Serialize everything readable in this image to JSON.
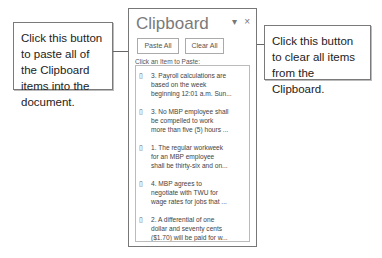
{
  "panel": {
    "title": "Clipboard",
    "dropdown_icon": "▾",
    "close_icon": "×",
    "paste_all_label": "Paste All",
    "clear_all_label": "Clear All",
    "hint": "Click an Item to Paste:"
  },
  "items": [
    {
      "text": "3. Payroll calculations are\nbased on the week\nbeginning 12:01 a.m. Sun..."
    },
    {
      "text": "3. No MBP employee shall\nbe compelled to work\nmore than five (5) hours ..."
    },
    {
      "text": "1. The regular workweek\nfor an MBP employee\nshall be thirty-six and on..."
    },
    {
      "text": "4. MBP agrees to\nnegotiate with TWU for\nwage rates for jobs that ..."
    },
    {
      "text": "2. A differential of one\ndollar and seventy cents\n($1.70) will be paid for w..."
    }
  ],
  "callouts": {
    "left": "Click this button to paste all of the Clipboard items into the document.",
    "right": "Click this button to clear all items from the Clipboard."
  }
}
